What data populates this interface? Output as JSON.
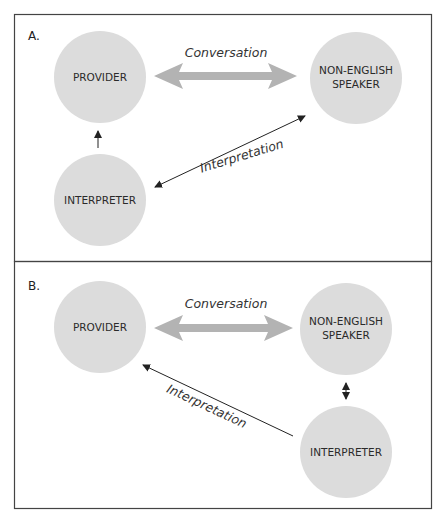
{
  "figure": {
    "panels": [
      {
        "id": "A",
        "label": "A.",
        "nodes": {
          "provider": "PROVIDER",
          "speaker_line1": "NON-ENGLISH",
          "speaker_line2": "SPEAKER",
          "interpreter": "INTERPRETER"
        },
        "edges": {
          "conversation": "Conversation",
          "interpretation": "Interpretation"
        }
      },
      {
        "id": "B",
        "label": "B.",
        "nodes": {
          "provider": "PROVIDER",
          "speaker_line1": "NON-ENGLISH",
          "speaker_line2": "SPEAKER",
          "interpreter": "INTERPRETER"
        },
        "edges": {
          "conversation": "Conversation",
          "interpretation": "Interpretation"
        }
      }
    ],
    "colors": {
      "node_fill": "#dcdcdc",
      "conversation_arrow": "#b3b3b3",
      "line": "#222222",
      "border": "#444444"
    }
  }
}
